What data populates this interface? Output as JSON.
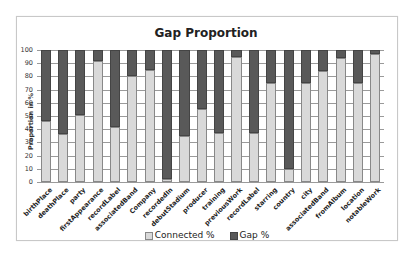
{
  "chart_data": {
    "type": "bar",
    "stacked": true,
    "title": "Gap Proportion",
    "xlabel": "",
    "ylabel": "Proportion in %",
    "ylim": [
      0,
      100
    ],
    "yticks": [
      0,
      10,
      20,
      30,
      40,
      50,
      60,
      70,
      80,
      90,
      100
    ],
    "grid": true,
    "legend_position": "bottom",
    "categories": [
      "birthPlace",
      "deathPlace",
      "party",
      "firstAppearance",
      "recordLabel",
      "associatedBand",
      "Company",
      "recordedIn",
      "debutStadium",
      "producer",
      "training",
      "previousWork",
      "recordLabel",
      "starring",
      "country",
      "city",
      "associatedBand",
      "fromAlbum",
      "location",
      "notableWork"
    ],
    "series": [
      {
        "name": "Connected %",
        "color": "#d9d9d9",
        "values": [
          46,
          36,
          51,
          92,
          42,
          80,
          85,
          2,
          35,
          55,
          37,
          95,
          37,
          75,
          10,
          75,
          84,
          94,
          75,
          97
        ]
      },
      {
        "name": "Gap %",
        "color": "#595959",
        "values": [
          54,
          64,
          49,
          8,
          58,
          20,
          15,
          98,
          65,
          45,
          63,
          5,
          63,
          25,
          90,
          25,
          16,
          6,
          25,
          3
        ]
      }
    ]
  },
  "legend": {
    "connected_label": "Connected %",
    "gap_label": "Gap %"
  }
}
